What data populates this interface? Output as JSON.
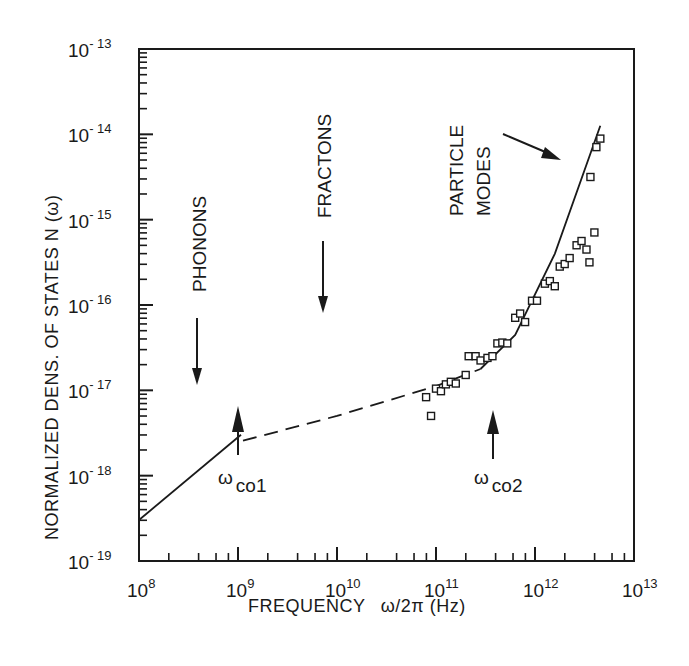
{
  "chart_data": {
    "type": "scatter",
    "title": "",
    "xlabel": "FREQUENCY ω/2π (Hz)",
    "ylabel": "NORMALIZED DENS. OF STATES N(ω)",
    "xscale": "log",
    "yscale": "log",
    "xlim": [
      100000000.0,
      10000000000000.0
    ],
    "ylim": [
      1e-19,
      1e-13
    ],
    "grid": false,
    "legend": null,
    "x_ticks": [
      {
        "base": "10",
        "exp": "8"
      },
      {
        "base": "10",
        "exp": "9"
      },
      {
        "base": "10",
        "exp": "10"
      },
      {
        "base": "10",
        "exp": "11"
      },
      {
        "base": "10",
        "exp": "12"
      },
      {
        "base": "10",
        "exp": "13"
      }
    ],
    "y_ticks": [
      {
        "base": "10",
        "exp": "- 13"
      },
      {
        "base": "10",
        "exp": "- 14"
      },
      {
        "base": "10",
        "exp": "- 15"
      },
      {
        "base": "10",
        "exp": "- 16"
      },
      {
        "base": "10",
        "exp": "- 17"
      },
      {
        "base": "10",
        "exp": "- 18"
      },
      {
        "base": "10",
        "exp": "- 19"
      }
    ],
    "series": [
      {
        "name": "Phonons (solid line)",
        "style": "solid",
        "log_points": [
          [
            8.0,
            -18.52
          ],
          [
            9.03,
            -17.52
          ]
        ]
      },
      {
        "name": "Fractons (dashed line)",
        "style": "dashed",
        "log_points": [
          [
            9.05,
            -17.59
          ],
          [
            10.0,
            -17.3
          ],
          [
            11.0,
            -16.95
          ],
          [
            11.45,
            -16.75
          ]
        ]
      },
      {
        "name": "Particle modes (solid line)",
        "style": "solid",
        "log_points": [
          [
            11.45,
            -16.75
          ],
          [
            11.8,
            -16.35
          ],
          [
            12.2,
            -15.4
          ],
          [
            12.66,
            -13.9
          ]
        ]
      },
      {
        "name": "Measured data (open squares)",
        "style": "marker-square",
        "log_points": [
          [
            10.9,
            -17.08
          ],
          [
            10.95,
            -17.3
          ],
          [
            11.0,
            -16.98
          ],
          [
            11.05,
            -17.01
          ],
          [
            11.1,
            -16.93
          ],
          [
            11.15,
            -16.9
          ],
          [
            11.2,
            -16.92
          ],
          [
            11.3,
            -16.82
          ],
          [
            11.33,
            -16.6
          ],
          [
            11.4,
            -16.6
          ],
          [
            11.45,
            -16.65
          ],
          [
            11.52,
            -16.62
          ],
          [
            11.57,
            -16.6
          ],
          [
            11.62,
            -16.45
          ],
          [
            11.67,
            -16.44
          ],
          [
            11.72,
            -16.45
          ],
          [
            11.8,
            -16.15
          ],
          [
            11.85,
            -16.1
          ],
          [
            11.9,
            -16.2
          ],
          [
            11.97,
            -15.95
          ],
          [
            12.02,
            -15.95
          ],
          [
            12.1,
            -15.75
          ],
          [
            12.15,
            -15.72
          ],
          [
            12.2,
            -15.78
          ],
          [
            12.25,
            -15.55
          ],
          [
            12.3,
            -15.52
          ],
          [
            12.35,
            -15.45
          ],
          [
            12.42,
            -15.3
          ],
          [
            12.47,
            -15.25
          ],
          [
            12.52,
            -15.35
          ],
          [
            12.55,
            -15.5
          ],
          [
            12.6,
            -15.15
          ],
          [
            12.66,
            -14.05
          ],
          [
            12.62,
            -14.15
          ],
          [
            12.56,
            -14.5
          ]
        ]
      }
    ],
    "annotations": [
      {
        "text": "PHONONS",
        "orientation": "vertical",
        "arrow": "down"
      },
      {
        "text": "FRACTONS",
        "orientation": "vertical",
        "arrow": "down"
      },
      {
        "text": "PARTICLE",
        "orientation": "vertical"
      },
      {
        "text": "MODES",
        "orientation": "vertical",
        "arrow": "diagonal-down-right"
      },
      {
        "text": "ω",
        "sub": "co1",
        "arrow": "up",
        "x_log": 9.0
      },
      {
        "text": "ω",
        "sub": "co2",
        "arrow": "up",
        "x_log": 11.55
      }
    ]
  },
  "labels": {
    "xlabel_main": "FREQUENCY",
    "xlabel_var": "ω/2π (Hz)",
    "ylabel": "NORMALIZED DENS. OF STATES N (ω)",
    "phonons": "PHONONS",
    "fractons": "FRACTONS",
    "particle": "PARTICLE",
    "modes": "MODES",
    "omega": "ω",
    "co1": "co1",
    "co2": "co2"
  }
}
